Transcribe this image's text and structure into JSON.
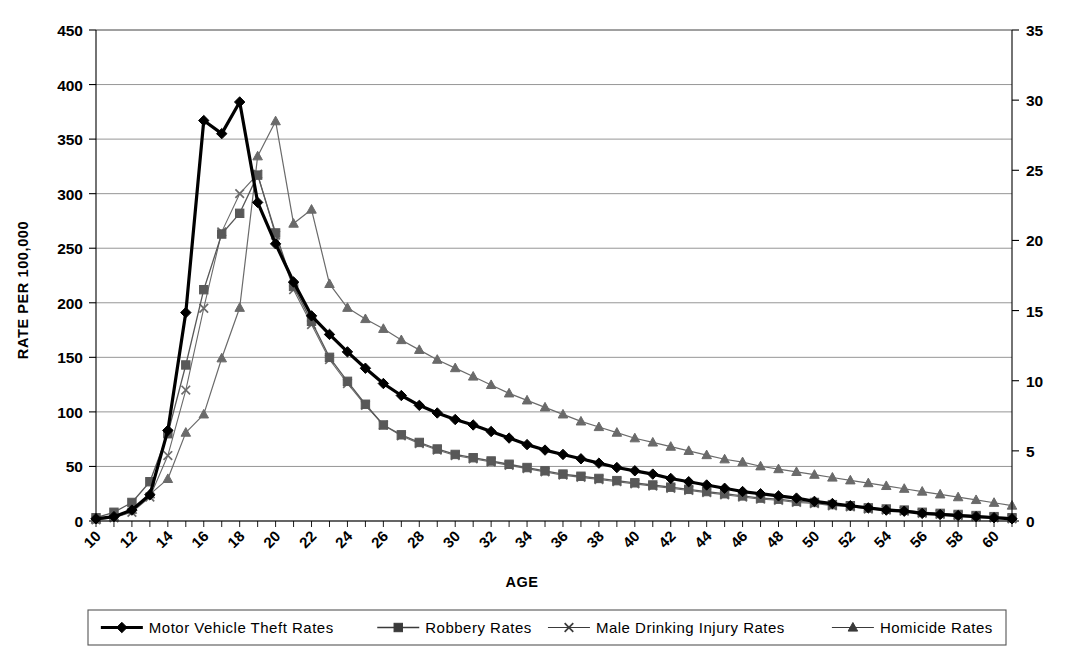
{
  "chart_data": {
    "type": "line",
    "title": "",
    "xlabel": "AGE",
    "ylabel": "RATE PER 100,000",
    "ylabel_right": "",
    "xlim": [
      10,
      61
    ],
    "ylim": [
      0,
      450
    ],
    "ylim_right": [
      0,
      35
    ],
    "grid": true,
    "legend_position": "bottom",
    "x": [
      10,
      11,
      12,
      13,
      14,
      15,
      16,
      17,
      18,
      19,
      20,
      21,
      22,
      23,
      24,
      25,
      26,
      27,
      28,
      29,
      30,
      31,
      32,
      33,
      34,
      35,
      36,
      37,
      38,
      39,
      40,
      41,
      42,
      43,
      44,
      45,
      46,
      47,
      48,
      49,
      50,
      51,
      52,
      53,
      54,
      55,
      56,
      57,
      58,
      59,
      60,
      61
    ],
    "x_tick_labels": [
      "10",
      "12",
      "14",
      "16",
      "18",
      "20",
      "22",
      "24",
      "26",
      "28",
      "30",
      "32",
      "34",
      "36",
      "38",
      "40",
      "42",
      "44",
      "46",
      "48",
      "50",
      "52",
      "54",
      "56",
      "58",
      "60"
    ],
    "y_tick_labels": [
      "0",
      "50",
      "100",
      "150",
      "200",
      "250",
      "300",
      "350",
      "400",
      "450"
    ],
    "y_right_tick_labels": [
      "0",
      "5",
      "10",
      "15",
      "20",
      "25",
      "30",
      "35"
    ],
    "series": [
      {
        "name": "Motor Vehicle Theft Rates",
        "axis": "left",
        "marker": "diamond",
        "color": "#000000",
        "line_width": 3.2,
        "values": [
          2,
          4,
          10,
          24,
          83,
          191,
          367,
          355,
          384,
          292,
          254,
          219,
          188,
          171,
          155,
          140,
          126,
          115,
          106,
          99,
          93,
          88,
          82,
          76,
          70,
          65,
          61,
          57,
          53,
          49,
          46,
          43,
          39,
          36,
          33,
          30,
          27,
          25,
          23,
          21,
          18,
          16,
          14,
          12,
          10,
          9,
          7,
          6,
          5,
          4,
          3,
          2
        ]
      },
      {
        "name": "Robbery Rates",
        "axis": "left",
        "marker": "square",
        "color": "#585858",
        "line_width": 1.3,
        "values": [
          3,
          8,
          17,
          36,
          80,
          143,
          212,
          263,
          282,
          317,
          264,
          215,
          183,
          150,
          128,
          107,
          88,
          79,
          72,
          66,
          61,
          58,
          55,
          52,
          49,
          46,
          43,
          41,
          39,
          37,
          35,
          33,
          31,
          29,
          27,
          25,
          23,
          21,
          20,
          18,
          17,
          15,
          14,
          12,
          11,
          10,
          8,
          7,
          6,
          5,
          4,
          3
        ]
      },
      {
        "name": "Male Drinking Injury Rates",
        "axis": "left",
        "marker": "cross",
        "color": "#6a6a6a",
        "line_width": 1.1,
        "values": [
          1,
          3,
          8,
          22,
          60,
          120,
          195,
          265,
          300,
          318,
          262,
          212,
          180,
          148,
          126,
          106,
          88,
          78,
          71,
          65,
          60,
          57,
          54,
          51,
          48,
          45,
          42,
          40,
          38,
          36,
          34,
          32,
          30,
          28,
          26,
          24,
          22,
          20,
          19,
          17,
          16,
          14,
          13,
          11,
          10,
          9,
          7,
          6,
          5,
          4,
          3,
          2
        ]
      },
      {
        "name": "Homicide Rates",
        "axis": "right",
        "marker": "triangle",
        "color": "#6a6a6a",
        "line_width": 1.2,
        "values": [
          0.1,
          0.3,
          0.8,
          1.9,
          3.0,
          6.3,
          7.6,
          11.6,
          15.2,
          26.0,
          28.5,
          21.2,
          22.2,
          16.9,
          15.2,
          14.4,
          13.7,
          12.9,
          12.2,
          11.5,
          10.9,
          10.3,
          9.7,
          9.1,
          8.6,
          8.1,
          7.6,
          7.1,
          6.7,
          6.3,
          5.9,
          5.6,
          5.3,
          5.0,
          4.7,
          4.4,
          4.2,
          3.9,
          3.7,
          3.5,
          3.3,
          3.1,
          2.9,
          2.7,
          2.5,
          2.3,
          2.1,
          1.9,
          1.7,
          1.5,
          1.3,
          1.1
        ]
      }
    ]
  },
  "legend": {
    "items": [
      {
        "label": "Motor  Vehicle  Theft  Rates",
        "marker": "diamond",
        "color": "#000000",
        "line_width": 3.2
      },
      {
        "label": "Robbery  Rates",
        "marker": "square",
        "color": "#3a3a3a",
        "line_width": 1.3
      },
      {
        "label": "Male  Drinking  Injury  Rates",
        "marker": "cross",
        "color": "#3a3a3a",
        "line_width": 1.1
      },
      {
        "label": "Homicide  Rates",
        "marker": "triangle",
        "color": "#3a3a3a",
        "line_width": 1.2
      }
    ]
  }
}
